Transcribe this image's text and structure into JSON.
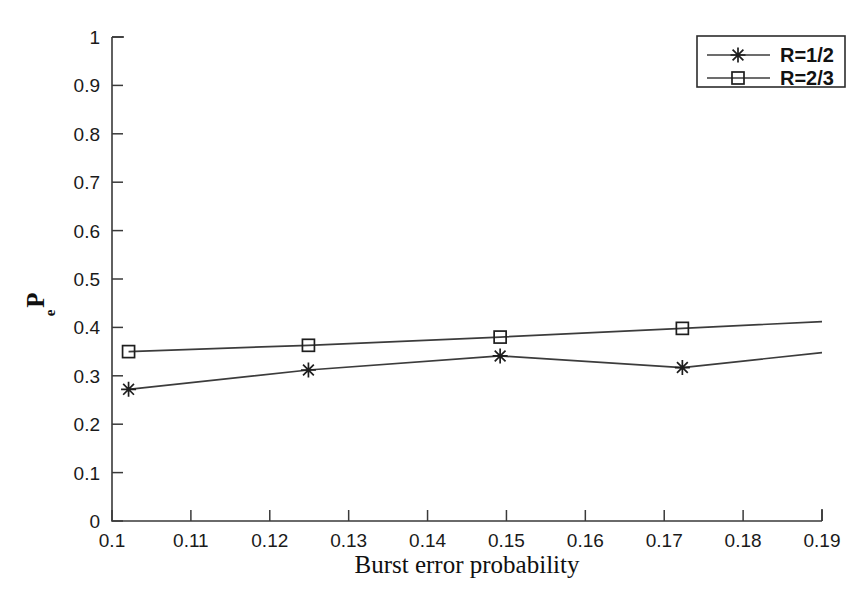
{
  "chart_data": {
    "type": "line",
    "title": "",
    "xlabel": "Burst error probability",
    "ylabel": "P_e",
    "ylabel_base": "P",
    "ylabel_sub": "e",
    "xlim": [
      0.1,
      0.19
    ],
    "ylim": [
      0,
      1
    ],
    "grid": false,
    "legend_position": "top-right",
    "x_ticks": [
      "0.1",
      "0.11",
      "0.12",
      "0.13",
      "0.14",
      "0.15",
      "0.16",
      "0.17",
      "0.18",
      "0.19"
    ],
    "x_tick_values": [
      0.1,
      0.11,
      0.12,
      0.13,
      0.14,
      0.15,
      0.16,
      0.17,
      0.18,
      0.19
    ],
    "y_ticks": [
      "0",
      "0.1",
      "0.2",
      "0.3",
      "0.4",
      "0.5",
      "0.6",
      "0.7",
      "0.8",
      "0.9",
      "1"
    ],
    "y_tick_values": [
      0,
      0.1,
      0.2,
      0.3,
      0.4,
      0.5,
      0.6,
      0.7,
      0.8,
      0.9,
      1
    ],
    "series": [
      {
        "name": "R=1/2",
        "marker": "asterisk",
        "color": "#3c3c3c",
        "x": [
          0.1021,
          0.1249,
          0.1492,
          0.1723,
          0.19
        ],
        "values": [
          0.272,
          0.312,
          0.341,
          0.317,
          0.348
        ]
      },
      {
        "name": "R=2/3",
        "marker": "square",
        "color": "#3c3c3c",
        "x": [
          0.1021,
          0.1249,
          0.1492,
          0.1723,
          0.19
        ],
        "values": [
          0.35,
          0.363,
          0.38,
          0.398,
          0.412
        ]
      }
    ]
  },
  "legend": {
    "entries": [
      {
        "label": "R=1/2",
        "marker": "asterisk"
      },
      {
        "label": "R=2/3",
        "marker": "square"
      }
    ]
  },
  "axes": {
    "x_title": "Burst error probability",
    "y_title_base": "P",
    "y_title_sub": "e"
  },
  "colors": {
    "line": "#3c3c3c",
    "axis": "#3a3a3a",
    "text": "#101010",
    "background": "#ffffff"
  }
}
